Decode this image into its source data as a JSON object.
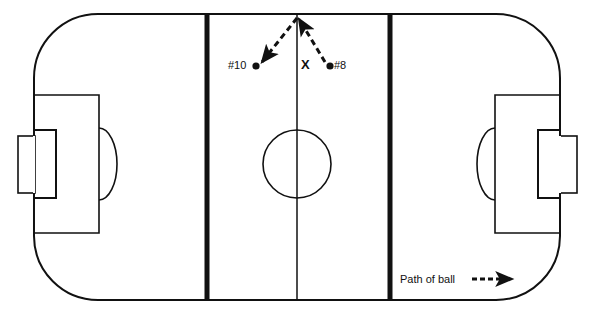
{
  "diagram": {
    "sport_surface": "field-hockey-style pitch",
    "background_color": "#ffffff",
    "line_color": "#111111"
  },
  "field": {
    "left": 34,
    "right": 560,
    "top": 14,
    "bottom": 300,
    "corner_radius": 64,
    "boundary_stroke_width": 2,
    "center_line_x": 297,
    "center_line_stroke_width": 1.5,
    "quarter_lines": [
      {
        "name": "left-25-yard-line",
        "x": 207,
        "stroke_width": 5
      },
      {
        "name": "right-25-yard-line",
        "x": 390,
        "stroke_width": 5
      }
    ],
    "center_circle": {
      "cx": 297,
      "cy": 164,
      "r": 34
    }
  },
  "goals": [
    {
      "side": "left",
      "penalty_box": {
        "x": 34,
        "y": 95,
        "width": 65,
        "height": 138
      },
      "goal_area_box": {
        "x": 34,
        "y": 130,
        "width": 22,
        "height": 68
      },
      "goal_cage": {
        "x": 18,
        "y": 136,
        "width": 17,
        "height": 57
      },
      "shooting_arc": {
        "cx": 99,
        "cy": 164,
        "rx": 18,
        "ry": 36
      }
    },
    {
      "side": "right",
      "penalty_box": {
        "x": 495,
        "y": 95,
        "width": 65,
        "height": 138
      },
      "goal_area_box": {
        "x": 538,
        "y": 130,
        "width": 22,
        "height": 68
      },
      "goal_cage": {
        "x": 560,
        "y": 136,
        "width": 17,
        "height": 57
      },
      "shooting_arc": {
        "cx": 495,
        "cy": 164,
        "rx": 18,
        "ry": 36
      }
    }
  ],
  "markers": {
    "player_10": {
      "label": "#10",
      "dot_x": 256,
      "dot_y": 66
    },
    "player_8": {
      "label": "#8",
      "dot_x": 330,
      "dot_y": 66
    },
    "spot_x": {
      "label": "X",
      "x": 307,
      "y": 65
    }
  },
  "ball_paths": [
    {
      "name": "pass-to-player-10",
      "from_x": 297,
      "from_y": 18,
      "to_x": 262,
      "to_y": 62,
      "style": "dashed-arrow"
    },
    {
      "name": "pass-from-player-8",
      "from_x": 325,
      "from_y": 62,
      "to_x": 297,
      "to_y": 18,
      "style": "dashed-arrow"
    }
  ],
  "legend": {
    "label": "Path of ball",
    "arrow": {
      "name": "dashed-arrow-icon",
      "from_x": 472,
      "to_x": 516,
      "y": 279
    }
  }
}
